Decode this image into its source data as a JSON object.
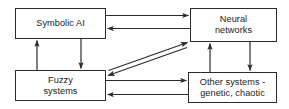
{
  "diagram": {
    "width": 289,
    "height": 109,
    "stroke_color": "#2b2b2b",
    "background_color": "#ffffff",
    "nodes": [
      {
        "id": "symbolic-ai",
        "label": "Symbolic AI"
      },
      {
        "id": "neural-networks",
        "label": "Neural\nnetworks"
      },
      {
        "id": "fuzzy-systems",
        "label": "Fuzzy\nsystems"
      },
      {
        "id": "other-systems",
        "label": "Other systems -\ngenetic, chaotic"
      }
    ],
    "edges": [
      {
        "id": "edge-symbolic-to-neural",
        "from": "symbolic-ai",
        "to": "neural-networks",
        "style": "single-arrow",
        "orientation": "horizontal"
      },
      {
        "id": "edge-neural-to-symbolic",
        "from": "neural-networks",
        "to": "symbolic-ai",
        "style": "single-arrow",
        "orientation": "horizontal"
      },
      {
        "id": "edge-fuzzy-to-symbolic",
        "from": "fuzzy-systems",
        "to": "symbolic-ai",
        "style": "single-arrow",
        "orientation": "vertical"
      },
      {
        "id": "edge-symbolic-to-fuzzy",
        "from": "symbolic-ai",
        "to": "fuzzy-systems",
        "style": "single-arrow",
        "orientation": "vertical"
      },
      {
        "id": "edge-other-to-neural",
        "from": "other-systems",
        "to": "neural-networks",
        "style": "single-arrow",
        "orientation": "vertical"
      },
      {
        "id": "edge-neural-to-other",
        "from": "neural-networks",
        "to": "other-systems",
        "style": "single-arrow",
        "orientation": "vertical"
      },
      {
        "id": "edge-fuzzy-to-other",
        "from": "fuzzy-systems",
        "to": "other-systems",
        "style": "single-arrow",
        "orientation": "horizontal"
      },
      {
        "id": "edge-other-to-fuzzy",
        "from": "other-systems",
        "to": "fuzzy-systems",
        "style": "single-arrow",
        "orientation": "horizontal"
      },
      {
        "id": "edge-fuzzy-neural-diagonal",
        "from": "fuzzy-systems",
        "to": "neural-networks",
        "style": "double-arrow",
        "orientation": "diagonal"
      }
    ]
  }
}
